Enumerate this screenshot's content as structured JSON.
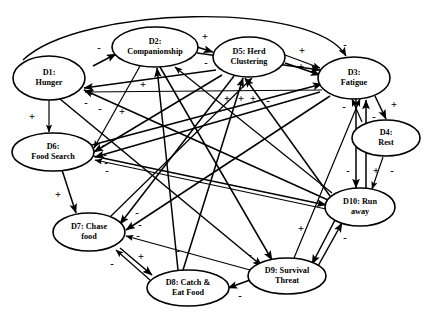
{
  "diagram": {
    "type": "causal-loop-diagram",
    "title": "",
    "nodes": [
      {
        "id": "D1",
        "label_line1": "D1:",
        "label_line2": "Hunger",
        "cx": 49,
        "cy": 78,
        "rx": 36,
        "ry": 22
      },
      {
        "id": "D2",
        "label_line1": "D2:",
        "label_line2": "Companionship",
        "cx": 155,
        "cy": 47,
        "rx": 43,
        "ry": 20
      },
      {
        "id": "D5",
        "label_line1": "D5:  Herd",
        "label_line2": "Clustering",
        "cx": 249,
        "cy": 57,
        "rx": 36,
        "ry": 20
      },
      {
        "id": "D3",
        "label_line1": "D3:",
        "label_line2": "Fatigue",
        "cx": 354,
        "cy": 78,
        "rx": 36,
        "ry": 21
      },
      {
        "id": "D4",
        "label_line1": "D4:",
        "label_line2": "Rest",
        "cx": 386,
        "cy": 138,
        "rx": 34,
        "ry": 18
      },
      {
        "id": "D6",
        "label_line1": "D6:",
        "label_line2": "Food Search",
        "cx": 53,
        "cy": 152,
        "rx": 41,
        "ry": 19
      },
      {
        "id": "D10",
        "label_line1": "D10:  Run",
        "label_line2": "away",
        "cx": 360,
        "cy": 207,
        "rx": 35,
        "ry": 19
      },
      {
        "id": "D7",
        "label_line1": "D7:  Chase",
        "label_line2": "food",
        "cx": 89,
        "cy": 232,
        "rx": 36,
        "ry": 19
      },
      {
        "id": "D9",
        "label_line1": "D9:  Survival",
        "label_line2": "Threat",
        "cx": 287,
        "cy": 276,
        "rx": 39,
        "ry": 18
      },
      {
        "id": "D8",
        "label_line1": "D8:  Catch &",
        "label_line2": "Eat Food",
        "cx": 188,
        "cy": 288,
        "rx": 41,
        "ry": 18
      }
    ],
    "edges": [
      {
        "from": "D1",
        "to": "D2",
        "sign": "-",
        "sx": 93,
        "sy": 66,
        "ex": 116,
        "ey": 54,
        "label_x": 99,
        "label_y": 49
      },
      {
        "from": "D1",
        "to": "D3",
        "sign": "-",
        "arc": true,
        "label_x": 345,
        "label_y": 46
      },
      {
        "from": "D1",
        "to": "D6",
        "sign": "+",
        "sx": 49,
        "sy": 100,
        "ex": 49,
        "ey": 132,
        "label_x": 32,
        "label_y": 118
      },
      {
        "from": "D2",
        "to": "D5",
        "sign": "+",
        "sx": 197,
        "sy": 47,
        "ex": 213,
        "ey": 52,
        "label_x": 205,
        "label_y": 38
      },
      {
        "from": "D2",
        "to": "D3",
        "sign": "-",
        "sx": 197,
        "sy": 53,
        "ex": 320,
        "ey": 70,
        "label_x": 206,
        "label_y": 64
      },
      {
        "from": "D5",
        "to": "D3",
        "sign": "+",
        "sx": 285,
        "sy": 55,
        "ex": 320,
        "ey": 68,
        "label_x": 302,
        "label_y": 52
      },
      {
        "from": "D5",
        "to": "D3",
        "sign": "+",
        "sx": 285,
        "sy": 63,
        "ex": 320,
        "ey": 75,
        "label_x": 301,
        "label_y": 68
      },
      {
        "from": "D3",
        "to": "D4",
        "sign": "+",
        "sx": 375,
        "sy": 96,
        "ex": 386,
        "ey": 119,
        "label_x": 394,
        "label_y": 106
      },
      {
        "from": "D4",
        "to": "D3",
        "sign": "-",
        "sx": 362,
        "sy": 122,
        "ex": 352,
        "ey": 99,
        "label_x": 344,
        "label_y": 108
      },
      {
        "from": "D6",
        "to": "D7",
        "sign": "+",
        "sx": 62,
        "sy": 170,
        "ex": 76,
        "ey": 213,
        "label_x": 58,
        "label_y": 196
      },
      {
        "from": "D7",
        "to": "D8",
        "sign": "+",
        "sx": 120,
        "sy": 248,
        "ex": 152,
        "ey": 275,
        "label_x": 141,
        "label_y": 258
      },
      {
        "from": "D8",
        "to": "D7",
        "sign": "-",
        "sx": 150,
        "sy": 280,
        "ex": 116,
        "ey": 250,
        "label_x": 112,
        "label_y": 265
      },
      {
        "from": "D10",
        "to": "D9",
        "sign": "+",
        "sx": 335,
        "sy": 220,
        "ex": 312,
        "ey": 264,
        "label_x": 301,
        "label_y": 230
      },
      {
        "from": "D9",
        "to": "D10",
        "sign": "-",
        "sx": 318,
        "sy": 266,
        "ex": 342,
        "ey": 223,
        "label_x": 345,
        "label_y": 239
      },
      {
        "from": "D9",
        "to": "D3",
        "sign": "-",
        "sx": 294,
        "sy": 258,
        "ex": 360,
        "ey": 99,
        "label_x": 374,
        "label_y": 118
      },
      {
        "from": "D9",
        "to": "D8",
        "sign": "-",
        "sx": 250,
        "sy": 280,
        "ex": 228,
        "ey": 288,
        "label_x": 240,
        "label_y": 297
      },
      {
        "from": "D5",
        "to": "D1",
        "sign": "-",
        "sx": 216,
        "sy": 70,
        "ex": 84,
        "ey": 88,
        "label_x": 86,
        "label_y": 104
      },
      {
        "from": "D3",
        "to": "D1",
        "sign": "-",
        "sx": 322,
        "sy": 90,
        "ex": 85,
        "ey": 92,
        "label_x": 100,
        "label_y": 110
      },
      {
        "from": "D10",
        "to": "D1",
        "sign": "+",
        "sx": 328,
        "sy": 200,
        "ex": 84,
        "ey": 90,
        "label_x": 122,
        "label_y": 113
      },
      {
        "from": "D10",
        "to": "D5",
        "sign": "+",
        "sx": 330,
        "sy": 196,
        "ex": 245,
        "ey": 78,
        "label_x": 227,
        "label_y": 100
      },
      {
        "from": "D10",
        "to": "D2",
        "sign": "-",
        "sx": 332,
        "sy": 193,
        "ex": 175,
        "ey": 67,
        "label_x": 300,
        "label_y": 90
      },
      {
        "from": "D8",
        "to": "D5",
        "sign": "+",
        "sx": 183,
        "sy": 270,
        "ex": 243,
        "ey": 78,
        "label_x": 241,
        "label_y": 100
      },
      {
        "from": "D8",
        "to": "D2",
        "sign": "+",
        "sx": 178,
        "sy": 270,
        "ex": 157,
        "ey": 68,
        "label_x": 143,
        "label_y": 86
      },
      {
        "from": "D7",
        "to": "D5",
        "sign": "+",
        "sx": 110,
        "sy": 217,
        "ex": 252,
        "ey": 78,
        "label_x": 253,
        "label_y": 100
      },
      {
        "from": "D6",
        "to": "D3",
        "sign": "-",
        "sx": 92,
        "sy": 145,
        "ex": 322,
        "ey": 84,
        "label_x": 268,
        "label_y": 102
      },
      {
        "from": "D6",
        "to": "D10",
        "sign": "-",
        "sx": 93,
        "sy": 156,
        "ex": 326,
        "ey": 205,
        "label_x": 322,
        "label_y": 186
      },
      {
        "from": "D4",
        "to": "D10",
        "sign": "-",
        "sx": 383,
        "sy": 157,
        "ex": 372,
        "ey": 189,
        "label_x": 392,
        "label_y": 172
      },
      {
        "from": "D3",
        "to": "D10",
        "sign": "-",
        "sx": 356,
        "sy": 99,
        "ex": 356,
        "ey": 188,
        "label_x": 348,
        "label_y": 172
      },
      {
        "from": "D10",
        "to": "D3",
        "sign": "+",
        "sx": 366,
        "sy": 189,
        "ex": 366,
        "ey": 100,
        "label_x": 376,
        "label_y": 172
      },
      {
        "from": "D9",
        "to": "D7",
        "sign": "-",
        "sx": 250,
        "sy": 270,
        "ex": 126,
        "ey": 236,
        "label_x": 138,
        "label_y": 237
      },
      {
        "from": "D5",
        "to": "D7",
        "sign": "-",
        "sx": 234,
        "sy": 76,
        "ex": 120,
        "ey": 224,
        "label_x": 137,
        "label_y": 214
      },
      {
        "from": "D3",
        "to": "D7",
        "sign": "-",
        "sx": 330,
        "sy": 96,
        "ex": 126,
        "ey": 230,
        "label_x": 140,
        "label_y": 226
      },
      {
        "from": "D2",
        "to": "D6",
        "sign": "-",
        "sx": 140,
        "sy": 66,
        "ex": 94,
        "ey": 148,
        "label_x": 104,
        "label_y": 146
      },
      {
        "from": "D5",
        "to": "D6",
        "sign": "-",
        "sx": 222,
        "sy": 75,
        "ex": 94,
        "ey": 152,
        "label_x": 105,
        "label_y": 156
      },
      {
        "from": "D3",
        "to": "D6",
        "sign": "-",
        "sx": 320,
        "sy": 92,
        "ex": 95,
        "ey": 157,
        "label_x": 106,
        "label_y": 164
      },
      {
        "from": "D10",
        "to": "D6",
        "sign": "-",
        "sx": 326,
        "sy": 209,
        "ex": 95,
        "ey": 160,
        "label_x": 107,
        "label_y": 172
      },
      {
        "from": "D2",
        "to": "D9",
        "sign": "-",
        "sx": 160,
        "sy": 67,
        "ex": 272,
        "ey": 260,
        "label_x": 250,
        "label_y": 256
      },
      {
        "from": "D1",
        "to": "D9",
        "sign": "-",
        "sx": 60,
        "sy": 99,
        "ex": 262,
        "ey": 266,
        "label_x": 178,
        "label_y": 252
      }
    ],
    "node_count": 10,
    "edge_count": 38
  }
}
